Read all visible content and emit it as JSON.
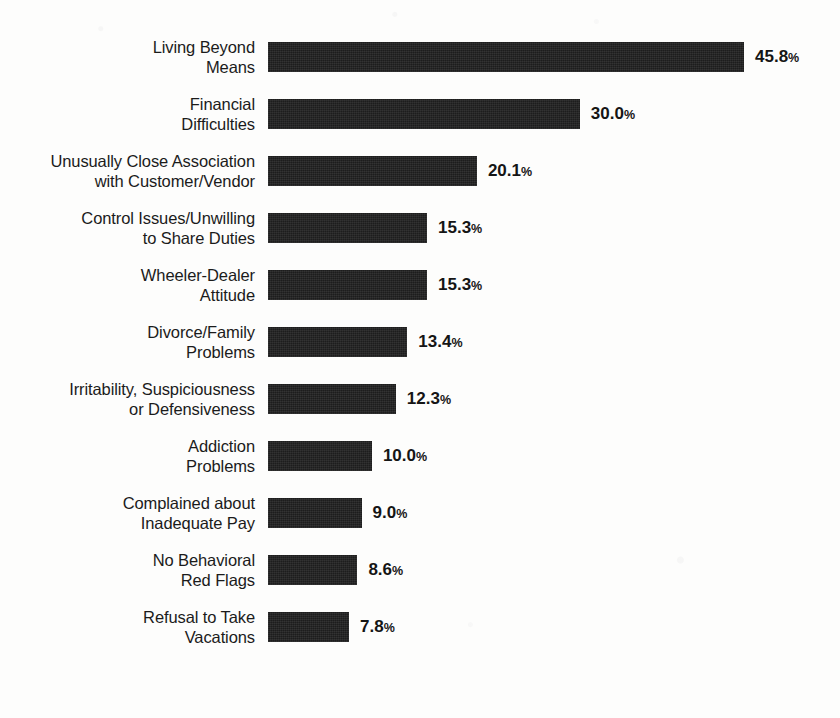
{
  "chart_data": {
    "type": "bar",
    "orientation": "horizontal",
    "title": "",
    "subtitle": "",
    "xlabel": "",
    "ylabel": "",
    "xlim": [
      0,
      45.8
    ],
    "grid": false,
    "legend": null,
    "value_suffix": "%",
    "bar_color": "#1d1d1d",
    "text_color": "#1b1b1b",
    "background_color": "#fdfdfc",
    "categories": [
      "Living Beyond\nMeans",
      "Financial\nDifficulties",
      "Unusually Close Association\nwith Customer/Vendor",
      "Control Issues/Unwilling\nto Share Duties",
      "Wheeler-Dealer\nAttitude",
      "Divorce/Family\nProblems",
      "Irritability, Suspiciousness\nor Defensiveness",
      "Addiction\nProblems",
      "Complained about\nInadequate Pay",
      "No Behavioral\nRed Flags",
      "Refusal to Take\nVacations"
    ],
    "values": [
      45.8,
      30.0,
      20.1,
      15.3,
      15.3,
      13.4,
      12.3,
      10.0,
      9.0,
      8.6,
      7.8
    ],
    "value_labels": [
      "45.8",
      "30.0",
      "20.1",
      "15.3",
      "15.3",
      "13.4",
      "12.3",
      "10.0",
      "9.0",
      "8.6",
      "7.8"
    ]
  }
}
